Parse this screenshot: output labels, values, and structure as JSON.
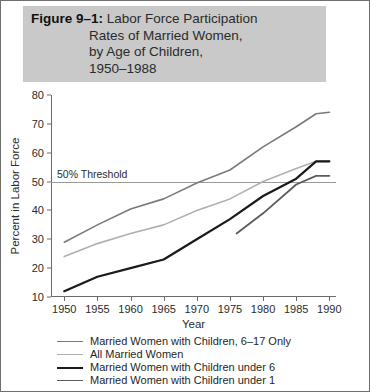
{
  "title": {
    "figure_label": "Figure 9–1:",
    "lines": [
      "Labor Force Participation",
      "Rates of Married Women,",
      "by Age of Children,",
      "1950–1988"
    ]
  },
  "annotation": {
    "threshold_label": "50% Threshold",
    "threshold_value": 50
  },
  "colors": {
    "series_6_17": "#7a7a7a",
    "series_all": "#b0b0b0",
    "series_under6": "#1a1a1a",
    "series_under1": "#5c5c5c",
    "title_band": "#c9c9c9",
    "axis": "#6b6b6b",
    "threshold": "#9a9a9a"
  },
  "chart_data": {
    "type": "line",
    "title": "Figure 9–1: Labor Force Participation Rates of Married Women, by Age of Children, 1950–1988",
    "xlabel": "Year",
    "ylabel": "Percent in Labor Force",
    "xlim": [
      1948,
      1991
    ],
    "ylim": [
      10,
      80
    ],
    "xticks": [
      1950,
      1955,
      1960,
      1965,
      1970,
      1975,
      1980,
      1985,
      1990
    ],
    "yticks": [
      10,
      20,
      30,
      40,
      50,
      60,
      70,
      80
    ],
    "grid": false,
    "legend_position": "below",
    "series": [
      {
        "name": "Married Women with Children, 6–17 Only",
        "color": "#7a7a7a",
        "width": 1.6,
        "x": [
          1950,
          1955,
          1960,
          1965,
          1970,
          1975,
          1980,
          1985,
          1988,
          1990
        ],
        "values": [
          29,
          35,
          40.5,
          44,
          49.5,
          54,
          62,
          69,
          73.5,
          74
        ]
      },
      {
        "name": "All Married Women",
        "color": "#b0b0b0",
        "width": 1.6,
        "x": [
          1950,
          1955,
          1960,
          1965,
          1970,
          1975,
          1980,
          1985,
          1988,
          1990
        ],
        "values": [
          24,
          28.5,
          32,
          35,
          40,
          44,
          50,
          54.5,
          57,
          57
        ]
      },
      {
        "name": "Married Women with Children under 6",
        "color": "#1a1a1a",
        "width": 2.2,
        "x": [
          1950,
          1955,
          1960,
          1965,
          1970,
          1975,
          1980,
          1985,
          1988,
          1990
        ],
        "values": [
          12,
          17,
          20,
          23,
          30,
          37,
          45,
          51,
          57,
          57
        ]
      },
      {
        "name": "Married Women with Children under 1",
        "color": "#5c5c5c",
        "width": 1.8,
        "x": [
          1976,
          1980,
          1985,
          1988,
          1990
        ],
        "values": [
          32,
          39,
          49,
          52,
          52
        ]
      }
    ]
  },
  "legend": [
    {
      "label": "Married Women with Children, 6–17 Only",
      "color": "#7a7a7a",
      "thickness": 1.6
    },
    {
      "label": "All Married Women",
      "color": "#b0b0b0",
      "thickness": 1.6
    },
    {
      "label": "Married Women with Children under 6",
      "color": "#1a1a1a",
      "thickness": 2.4
    },
    {
      "label": "Married Women with Children under 1",
      "color": "#5c5c5c",
      "thickness": 1.8
    }
  ]
}
